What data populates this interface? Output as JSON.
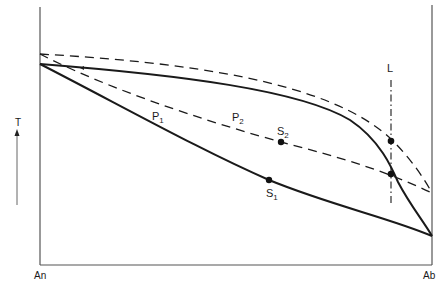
{
  "diagram": {
    "type": "phase-diagram",
    "y_axis_label": "T",
    "x_axis": {
      "left_label": "An",
      "right_label": "Ab"
    },
    "curves": {
      "solid_upper": "liquidus (solid)",
      "solid_lower": "solidus (solid)",
      "dashed_upper": "liquidus (dashed)",
      "dashed_lower": "solidus (dashed)"
    },
    "labels": {
      "p1": "P",
      "p1_sub": "1",
      "p2": "P",
      "p2_sub": "2",
      "s1": "S",
      "s1_sub": "1",
      "s2": "S",
      "s2_sub": "2",
      "l": "L"
    },
    "colors": {
      "line": "#1a1a1a",
      "axis": "#555555",
      "background": "#ffffff"
    }
  }
}
